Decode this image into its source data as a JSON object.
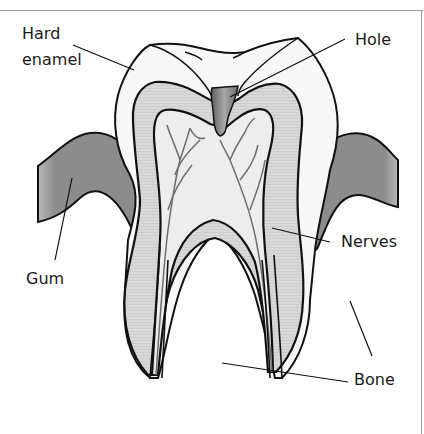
{
  "labels": {
    "hard_enamel_line1": "Hard",
    "hard_enamel_line2": "enamel",
    "hole": "Hole",
    "nerves": "Nerves",
    "gum": "Gum",
    "bone": "Bone"
  },
  "colors": {
    "gum": "#8c8c8c",
    "dentin": "#d6d6d6",
    "pulp": "#ececec",
    "enamel": "#f7f7f7",
    "hole": "#7a7a7a",
    "outline": "#111111",
    "nerve": "#6e6e6e"
  }
}
